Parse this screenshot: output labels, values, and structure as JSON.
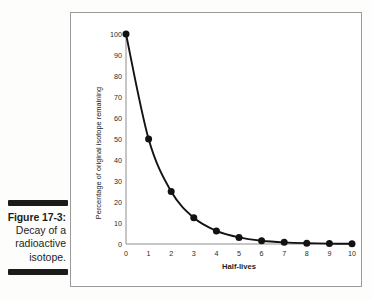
{
  "caption": {
    "figure_number": "Figure 17-3:",
    "line_1": "Decay of a",
    "line_2": "radioactive",
    "line_3": "isotope."
  },
  "colors": {
    "curve": "#121212",
    "axis": "#8d8d8d",
    "frame": "#9a9a9a",
    "rule": "#1b1b1b",
    "background": "#ffffff"
  },
  "chart_data": {
    "type": "line",
    "title": "",
    "xlabel": "Half-lives",
    "ylabel": "Percentage of original isotope remaining",
    "x": [
      0,
      1,
      2,
      3,
      4,
      5,
      6,
      7,
      8,
      9,
      10
    ],
    "values": [
      100,
      50,
      25,
      12.5,
      6.25,
      3.125,
      1.5625,
      0.78125,
      0.390625,
      0.1953125,
      0.09765625
    ],
    "xlim": [
      0,
      10
    ],
    "ylim": [
      0,
      100
    ],
    "xticks": [
      0,
      1,
      2,
      3,
      4,
      5,
      6,
      7,
      8,
      9,
      10
    ],
    "xtick_labels": [
      "0",
      "1",
      "2",
      "3",
      "4",
      "5",
      "6",
      "7",
      "8",
      "9",
      "10"
    ],
    "yticks": [
      0,
      10,
      20,
      30,
      40,
      50,
      60,
      70,
      80,
      90,
      100
    ],
    "ytick_labels": [
      "0",
      "10",
      "20",
      "30",
      "40",
      "50",
      "60",
      "70",
      "80",
      "90",
      "100"
    ],
    "grid": false,
    "legend": false,
    "markers": true
  }
}
